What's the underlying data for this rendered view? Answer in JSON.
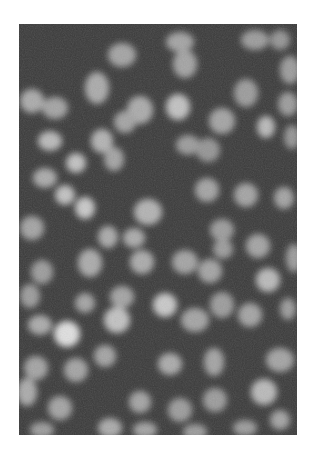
{
  "image": {
    "kind": "fluorescence-microscopy",
    "description": "Grayscale fluorescence micrograph of densely packed blurred cell nuclei on dark background",
    "frame": {
      "x": 19,
      "y": 24,
      "width": 278,
      "height": 411
    },
    "colors": {
      "background": "#3a3a3a",
      "nucleus_dim": "#6e6e6e",
      "nucleus_mid": "#8e8e8e",
      "nucleus_bright": "#d8d8d8",
      "page": "#ffffff"
    },
    "nuclei": [
      [
        122,
        55,
        14,
        12,
        0.55
      ],
      [
        180,
        42,
        14,
        10,
        0.55
      ],
      [
        255,
        40,
        14,
        10,
        0.5
      ],
      [
        280,
        40,
        10,
        10,
        0.45
      ],
      [
        185,
        64,
        12,
        14,
        0.55
      ],
      [
        97,
        88,
        12,
        16,
        0.6
      ],
      [
        290,
        70,
        10,
        14,
        0.5
      ],
      [
        246,
        93,
        12,
        14,
        0.5
      ],
      [
        32,
        101,
        12,
        12,
        0.6
      ],
      [
        55,
        108,
        13,
        11,
        0.55
      ],
      [
        140,
        110,
        13,
        14,
        0.6
      ],
      [
        178,
        107,
        12,
        13,
        0.75
      ],
      [
        125,
        122,
        11,
        11,
        0.55
      ],
      [
        222,
        121,
        13,
        13,
        0.55
      ],
      [
        266,
        127,
        9,
        11,
        0.7
      ],
      [
        288,
        104,
        10,
        12,
        0.5
      ],
      [
        50,
        141,
        12,
        10,
        0.7
      ],
      [
        102,
        141,
        11,
        12,
        0.65
      ],
      [
        292,
        137,
        8,
        12,
        0.45
      ],
      [
        188,
        145,
        12,
        10,
        0.5
      ],
      [
        76,
        163,
        10,
        10,
        0.75
      ],
      [
        114,
        159,
        10,
        12,
        0.55
      ],
      [
        45,
        178,
        12,
        10,
        0.6
      ],
      [
        208,
        150,
        12,
        12,
        0.45
      ],
      [
        65,
        195,
        10,
        10,
        0.75
      ],
      [
        85,
        208,
        10,
        11,
        0.8
      ],
      [
        148,
        212,
        14,
        13,
        0.65
      ],
      [
        207,
        190,
        12,
        12,
        0.55
      ],
      [
        246,
        195,
        12,
        12,
        0.55
      ],
      [
        284,
        198,
        10,
        11,
        0.55
      ],
      [
        32,
        228,
        12,
        12,
        0.55
      ],
      [
        108,
        237,
        10,
        11,
        0.6
      ],
      [
        134,
        238,
        11,
        10,
        0.6
      ],
      [
        222,
        230,
        12,
        11,
        0.5
      ],
      [
        258,
        246,
        12,
        12,
        0.55
      ],
      [
        42,
        272,
        11,
        12,
        0.5
      ],
      [
        90,
        263,
        12,
        14,
        0.6
      ],
      [
        142,
        262,
        12,
        12,
        0.6
      ],
      [
        185,
        262,
        13,
        12,
        0.55
      ],
      [
        223,
        249,
        10,
        10,
        0.5
      ],
      [
        210,
        271,
        12,
        12,
        0.55
      ],
      [
        294,
        258,
        8,
        14,
        0.5
      ],
      [
        268,
        280,
        12,
        12,
        0.7
      ],
      [
        30,
        296,
        10,
        12,
        0.5
      ],
      [
        122,
        297,
        12,
        11,
        0.55
      ],
      [
        165,
        305,
        12,
        12,
        0.8
      ],
      [
        85,
        303,
        10,
        10,
        0.55
      ],
      [
        222,
        305,
        12,
        13,
        0.5
      ],
      [
        250,
        315,
        12,
        12,
        0.55
      ],
      [
        40,
        325,
        12,
        10,
        0.6
      ],
      [
        67,
        334,
        13,
        13,
        0.95
      ],
      [
        117,
        320,
        13,
        13,
        0.75
      ],
      [
        195,
        320,
        14,
        12,
        0.55
      ],
      [
        288,
        309,
        8,
        11,
        0.5
      ],
      [
        105,
        356,
        11,
        11,
        0.55
      ],
      [
        36,
        368,
        12,
        12,
        0.55
      ],
      [
        76,
        370,
        12,
        12,
        0.55
      ],
      [
        170,
        364,
        12,
        11,
        0.6
      ],
      [
        214,
        362,
        10,
        14,
        0.55
      ],
      [
        280,
        360,
        14,
        12,
        0.55
      ],
      [
        27,
        392,
        10,
        14,
        0.6
      ],
      [
        60,
        408,
        12,
        12,
        0.55
      ],
      [
        140,
        402,
        11,
        11,
        0.55
      ],
      [
        180,
        410,
        12,
        12,
        0.5
      ],
      [
        264,
        392,
        13,
        13,
        0.7
      ],
      [
        215,
        400,
        12,
        12,
        0.5
      ],
      [
        280,
        420,
        10,
        10,
        0.55
      ],
      [
        42,
        430,
        12,
        8,
        0.5
      ],
      [
        110,
        428,
        12,
        10,
        0.6
      ],
      [
        195,
        432,
        12,
        8,
        0.5
      ],
      [
        245,
        428,
        12,
        8,
        0.5
      ],
      [
        145,
        430,
        12,
        8,
        0.55
      ]
    ]
  }
}
